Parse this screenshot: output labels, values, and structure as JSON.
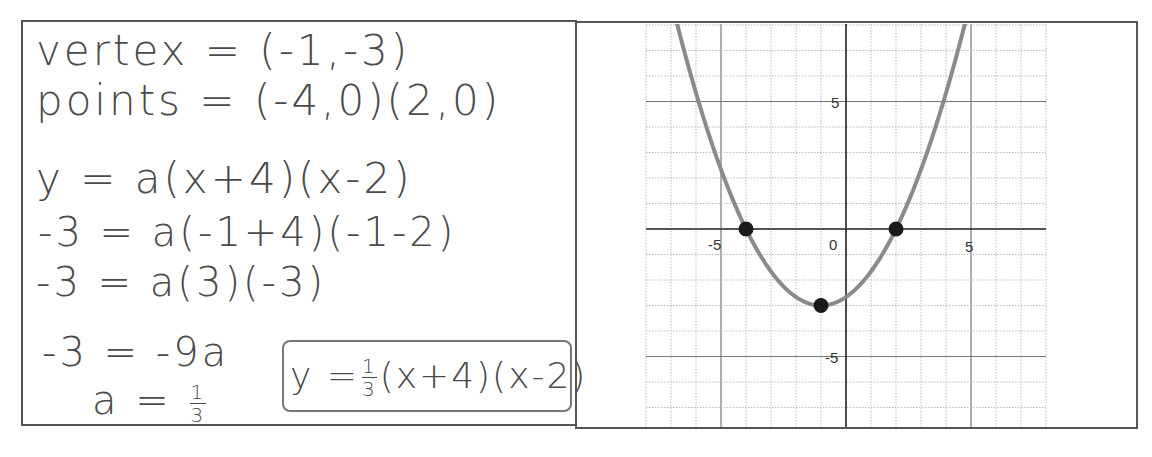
{
  "work": {
    "line1": "vertex = (-1,-3)",
    "line2": "points = (-4,0)(2,0)",
    "line3": "y = a(x+4)(x-2)",
    "line4": "-3 = a(-1+4)(-1-2)",
    "line5": "-3 = a(3)(-3)",
    "line6": "-3 = -9a",
    "line7_prefix": "a =",
    "line7_num": "1",
    "line7_den": "3",
    "answer_prefix": "y =",
    "answer_num": "1",
    "answer_den": "3",
    "answer_suffix": "(x+4)(x-2)"
  },
  "graph": {
    "tick_labels": {
      "x_neg5": "-5",
      "x_0": "0",
      "x_5": "5",
      "y_5": "5",
      "y_neg5": "-5"
    }
  },
  "chart_data": {
    "type": "line",
    "title": "",
    "xlabel": "",
    "ylabel": "",
    "function": "y = (1/3)(x+4)(x-2)",
    "xlim": [
      -8,
      8
    ],
    "ylim": [
      -8,
      8
    ],
    "grid": true,
    "major_tick_step": 5,
    "minor_grid_step": 1,
    "x_tick_labels": [
      "-5",
      "0",
      "5"
    ],
    "y_tick_labels": [
      "5",
      "-5"
    ],
    "highlighted_points": [
      {
        "label": "x-intercept",
        "x": -4,
        "y": 0
      },
      {
        "label": "x-intercept",
        "x": 2,
        "y": 0
      },
      {
        "label": "vertex",
        "x": -1,
        "y": -3
      }
    ],
    "curve_color": "#8a8a8a",
    "point_color": "#1a1a1a"
  }
}
